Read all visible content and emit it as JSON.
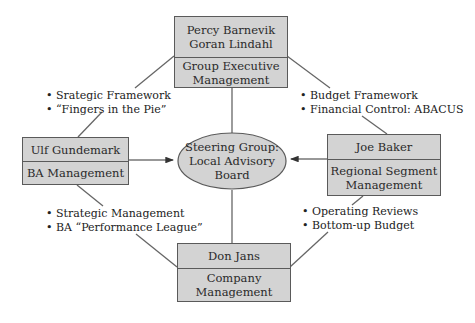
{
  "nodes": {
    "top": {
      "person": "Percy Barnevik\nGoran Lindahl",
      "role": "Group Executive\nManagement"
    },
    "left": {
      "person": "Ulf Gundemark",
      "role": "BA Management"
    },
    "right": {
      "person": "Joe Baker",
      "role": "Regional Segment\nManagement"
    },
    "bottom": {
      "person": "Don Jans",
      "role": "Company\nManagement"
    },
    "center": {
      "label": "Steering Group:\nLocal Advisory\nBoard"
    }
  },
  "annotations": {
    "top_left": [
      "Srategic Framework",
      "“Fingers in the Pie”"
    ],
    "top_right": [
      "Budget Framework",
      "Financial Control: ABACUS"
    ],
    "bottom_left": [
      "Strategic Management",
      "BA “Performance League”"
    ],
    "bottom_right": [
      "Operating Reviews",
      "Bottom-up Budget"
    ]
  },
  "colors": {
    "box_fill": "#d3d3d3",
    "border": "#5a5a5a",
    "line": "#555555"
  }
}
